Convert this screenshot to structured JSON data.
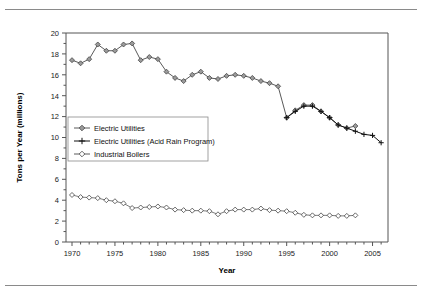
{
  "figure": {
    "has_top_rule": true,
    "has_bottom_rule": true,
    "background": "#ffffff"
  },
  "chart_data": {
    "type": "line",
    "title": "",
    "xlabel": "Year",
    "ylabel": "Tons per Year (millions)",
    "xlim": [
      1969.3,
      2006.8
    ],
    "ylim": [
      0,
      20
    ],
    "ytick_step": 2,
    "yminor_step": 1,
    "xtick_major_step": 5,
    "xminor_step": 1,
    "grid": false,
    "legend_position": "center-left",
    "xticklabels": [
      "1970",
      "1975",
      "1980",
      "1985",
      "1990",
      "1995",
      "2000",
      "2005"
    ],
    "xticks": [
      1970,
      1975,
      1980,
      1985,
      1990,
      1995,
      2000,
      2005
    ],
    "yticklabels": [
      "0",
      "2",
      "4",
      "6",
      "8",
      "10",
      "12",
      "14",
      "16",
      "18",
      "20"
    ],
    "yticks": [
      0,
      2,
      4,
      6,
      8,
      10,
      12,
      14,
      16,
      18,
      20
    ],
    "series": [
      {
        "name": "Electric Utilities",
        "marker": "diamond-filled",
        "color": "#9b9b9b",
        "line_color": "#5a5a5a",
        "x": [
          1970,
          1971,
          1972,
          1973,
          1974,
          1975,
          1976,
          1977,
          1978,
          1979,
          1980,
          1981,
          1982,
          1983,
          1984,
          1985,
          1986,
          1987,
          1988,
          1989,
          1990,
          1991,
          1992,
          1993,
          1994,
          1995,
          1996,
          1997,
          1998,
          1999,
          2000,
          2001,
          2002,
          2003
        ],
        "values": [
          17.4,
          17.1,
          17.5,
          18.9,
          18.3,
          18.3,
          18.9,
          19.0,
          17.4,
          17.7,
          17.5,
          16.3,
          15.7,
          15.4,
          16.0,
          16.3,
          15.7,
          15.6,
          15.9,
          16.0,
          15.9,
          15.7,
          15.4,
          15.2,
          14.9,
          11.9,
          12.6,
          13.1,
          13.1,
          12.5,
          11.9,
          11.2,
          10.9,
          11.1
        ],
        "last_label": "2003"
      },
      {
        "name": "Electric Utilities (Acid Rain Program)",
        "marker": "plus",
        "color": "#111111",
        "line_color": "#111111",
        "x": [
          1995,
          1996,
          1997,
          1998,
          1999,
          2000,
          2001,
          2002,
          2003,
          2004,
          2005,
          2006
        ],
        "values": [
          11.9,
          12.5,
          13.0,
          13.0,
          12.5,
          11.9,
          11.2,
          10.9,
          10.6,
          10.3,
          10.2,
          9.5
        ]
      },
      {
        "name": "Industrial Boilers",
        "marker": "diamond-open",
        "color": "#ffffff",
        "line_color": "#5a5a5a",
        "x": [
          1970,
          1971,
          1972,
          1973,
          1974,
          1975,
          1976,
          1977,
          1978,
          1979,
          1980,
          1981,
          1982,
          1983,
          1984,
          1985,
          1986,
          1987,
          1988,
          1989,
          1990,
          1991,
          1992,
          1993,
          1994,
          1995,
          1996,
          1997,
          1998,
          1999,
          2000,
          2001,
          2002,
          2003
        ],
        "values": [
          4.5,
          4.3,
          4.25,
          4.2,
          4.0,
          3.9,
          3.7,
          3.25,
          3.3,
          3.35,
          3.4,
          3.3,
          3.1,
          3.05,
          3.0,
          3.0,
          2.95,
          2.65,
          2.95,
          3.1,
          3.1,
          3.1,
          3.2,
          3.05,
          3.0,
          2.95,
          2.8,
          2.6,
          2.55,
          2.55,
          2.55,
          2.5,
          2.5,
          2.55
        ]
      }
    ],
    "legend": [
      {
        "label": "Electric Utilities",
        "marker": "diamond-filled"
      },
      {
        "label": "Electric Utilities (Acid Rain Program)",
        "marker": "plus"
      },
      {
        "label": "Industrial Boilers",
        "marker": "diamond-open"
      }
    ]
  }
}
